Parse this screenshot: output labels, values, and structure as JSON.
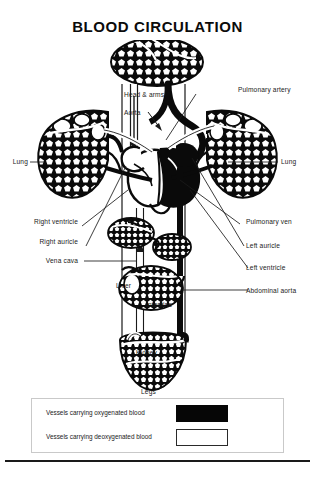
{
  "document": {
    "title": "BLOOD CIRCULATION"
  },
  "diagram": {
    "name": "human-blood-circulation-diagram",
    "labels": {
      "head_and_arms": "Head & arms",
      "aorta": "Aorta",
      "pulmonary_artery": "Pulmonary artery",
      "lung_right": "Lung",
      "lung_left": "Lung",
      "right_ventricle": "Right ventricle",
      "right_auricle": "Right auricle",
      "vena_cava": "Vena cava",
      "pulmonary_vein": "Pulmonary ven",
      "left_auricle": "Left auricle",
      "left_ventricle": "Left ventricle",
      "abdominal_aorta": "Abdominal aorta",
      "liver": "Liver",
      "intestine": "Intestine",
      "kidney": "Kidney",
      "legs": "Legs"
    }
  },
  "legend": {
    "rows": [
      {
        "text": "Vessels carrying oxygenated blood",
        "swatch": "filled",
        "color": "#060606"
      },
      {
        "text": "Vessels carrying deoxygenated blood",
        "swatch": "hollow",
        "color": "#ffffff"
      }
    ]
  },
  "colors": {
    "ink": "#111111",
    "paper": "#ffffff",
    "oxygenated": "#060606",
    "deoxygenated": "#ffffff",
    "legend_border": "#c9c9c9"
  }
}
